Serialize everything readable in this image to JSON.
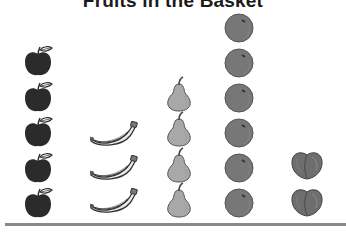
{
  "title": "Fruits in the Basket",
  "chart_data": {
    "type": "bar",
    "subtype": "pictograph",
    "title": "Fruits in the Basket",
    "categories": [
      "Apple",
      "Banana",
      "Pear",
      "Orange",
      "Peach"
    ],
    "values": [
      5,
      3,
      4,
      6,
      2
    ],
    "xlabel": "",
    "ylabel": "",
    "legend": null,
    "grid": false,
    "unit": "1 picture = 1 fruit"
  },
  "colors": {
    "apple": "#2b2b2b",
    "banana": "#e8e8e8",
    "pear": "#a8a8a8",
    "orange": "#777777",
    "peach": "#6e6e6e",
    "baseline": "#8a8a8a"
  }
}
